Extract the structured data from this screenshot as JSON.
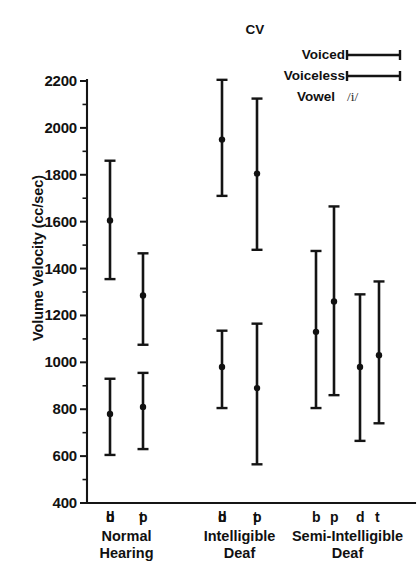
{
  "chart_data": {
    "type": "scatter",
    "title": "",
    "xlabel": "",
    "ylabel": "Volume Velocity (cc/sec)",
    "ylim": [
      400,
      2200
    ],
    "ytick_step": 200,
    "yticks": [
      400,
      600,
      800,
      1000,
      1200,
      1400,
      1600,
      1800,
      2000,
      2200
    ],
    "ytick_labels": [
      "400",
      "600",
      "800",
      "1000",
      "1200",
      "1400",
      "1600",
      "1800",
      "2000",
      "2200"
    ],
    "minor_tick_step": 100,
    "grid": false,
    "legend_position": "top-right",
    "error_style": "mean with range bars (capped)",
    "categories": [
      "b",
      "p",
      "d",
      "t"
    ],
    "groups": [
      {
        "name": "Normal Hearing",
        "name_lines": [
          "Normal",
          "Hearing"
        ],
        "letters": "b p   d t",
        "points": [
          {
            "label": "b",
            "mean": 1605,
            "low": 1355,
            "high": 1860
          },
          {
            "label": "p",
            "mean": 1285,
            "low": 1075,
            "high": 1465
          },
          {
            "label": "d",
            "mean": 780,
            "low": 605,
            "high": 930
          },
          {
            "label": "t",
            "mean": 810,
            "low": 630,
            "high": 955
          }
        ]
      },
      {
        "name": "Intelligible Deaf",
        "name_lines": [
          "Intelligible",
          "Deaf"
        ],
        "letters": "b p   d t",
        "points": [
          {
            "label": "b",
            "mean": 1950,
            "low": 1710,
            "high": 2205
          },
          {
            "label": "p",
            "mean": 1805,
            "low": 1480,
            "high": 2125
          },
          {
            "label": "d",
            "mean": 980,
            "low": 805,
            "high": 1135
          },
          {
            "label": "t",
            "mean": 890,
            "low": 565,
            "high": 1165
          }
        ]
      },
      {
        "name": "Semi-Intelligible Deaf",
        "name_lines": [
          "Semi-Intelligible",
          "Deaf"
        ],
        "letters": "b p   d t",
        "points": [
          {
            "label": "b",
            "mean": 1130,
            "low": 805,
            "high": 1475
          },
          {
            "label": "p",
            "mean": 1260,
            "low": 860,
            "high": 1665
          },
          {
            "label": "d",
            "mean": 980,
            "low": 665,
            "high": 1290
          },
          {
            "label": "t",
            "mean": 1030,
            "low": 740,
            "high": 1345
          }
        ]
      }
    ],
    "legend": {
      "title": "CV",
      "entries": [
        {
          "label": "Voiced",
          "marker": "capped-line"
        },
        {
          "label": "Voiceless",
          "marker": "capped-line"
        }
      ],
      "vowel_label": "Vowel",
      "vowel_symbol": "/i/"
    },
    "colors": {
      "ink": "#141414",
      "background": "#ffffff"
    }
  }
}
